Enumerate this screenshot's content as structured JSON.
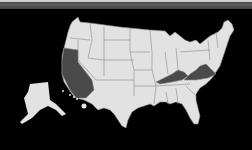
{
  "map": {
    "type": "choropleth",
    "region": "United States",
    "background_color": "#000000",
    "default_state_color": "#e2e2e2",
    "highlight_color": "#4a4a4a",
    "border_color": "#8a8a8a",
    "highlighted_states": [
      "California",
      "Kentucky",
      "Virginia"
    ],
    "insets": [
      "Alaska",
      "Hawaii"
    ]
  },
  "header_bar": {
    "color": "#555555"
  }
}
